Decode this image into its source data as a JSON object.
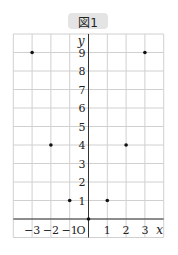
{
  "figure": {
    "label": "図1"
  },
  "chart_data": {
    "type": "scatter",
    "title": "図1",
    "xlabel": "x",
    "ylabel": "y",
    "origin_label": "O",
    "x_ticks": [
      -3,
      -2,
      -1,
      1,
      2,
      3
    ],
    "y_ticks": [
      1,
      2,
      3,
      4,
      5,
      6,
      7,
      8,
      9
    ],
    "xlim": [
      -4,
      4
    ],
    "ylim": [
      -1,
      10
    ],
    "grid": true,
    "points": [
      {
        "x": -3,
        "y": 9
      },
      {
        "x": -2,
        "y": 4
      },
      {
        "x": -1,
        "y": 1
      },
      {
        "x": 0,
        "y": 0
      },
      {
        "x": 1,
        "y": 1
      },
      {
        "x": 2,
        "y": 4
      },
      {
        "x": 3,
        "y": 9
      }
    ]
  },
  "colors": {
    "grid": "#d0d0d0",
    "axis": "#333333",
    "point": "#111111",
    "badge": "#e4e4e4"
  }
}
